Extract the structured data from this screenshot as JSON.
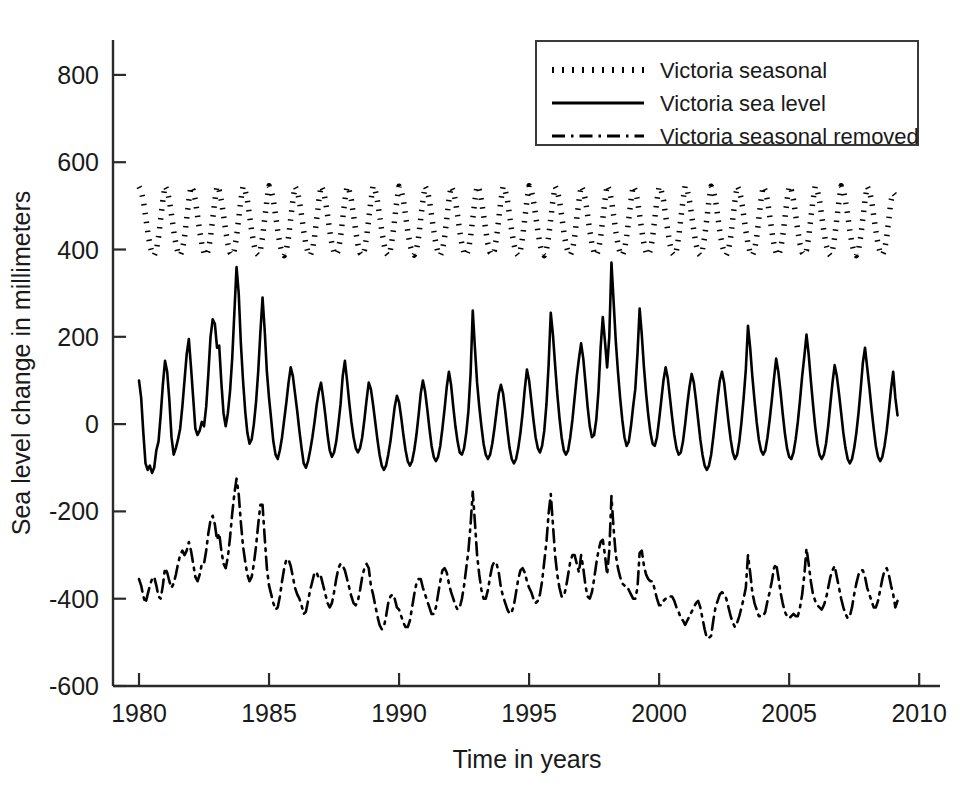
{
  "chart_data": {
    "type": "line",
    "title": "",
    "xlabel": "Time in years",
    "ylabel": "Sea level change in millimeters",
    "xlim": [
      1979.0,
      2010.8
    ],
    "ylim": [
      -600,
      880
    ],
    "xticks": [
      1980,
      1985,
      1990,
      1995,
      2000,
      2005,
      2010
    ],
    "xticklabels": [
      "1980",
      "1985",
      "1990",
      "1995",
      "2000",
      "2005",
      "2010"
    ],
    "yticks": [
      -600,
      -400,
      -200,
      0,
      200,
      400,
      600,
      800
    ],
    "yticklabels": [
      "-600",
      "-400",
      "-200",
      "0",
      "200",
      "400",
      "600",
      "800"
    ],
    "grid": false,
    "legend_position": "upper right",
    "axis_color": "#1a1a1a",
    "series": [
      {
        "name": "Victoria seasonal",
        "linestyle": "dotted",
        "color": "#000000",
        "x_start": 1980.0,
        "x_step": 0.0833333,
        "values": [
          544,
          534,
          512,
          478,
          442,
          412,
          392,
          386,
          398,
          428,
          470,
          512,
          546,
          536,
          513,
          479,
          443,
          413,
          392,
          386,
          398,
          428,
          470,
          513,
          545,
          535,
          513,
          478,
          442,
          412,
          392,
          386,
          398,
          428,
          470,
          512,
          546,
          536,
          512,
          479,
          443,
          413,
          393,
          386,
          399,
          429,
          471,
          513,
          545,
          535,
          513,
          478,
          442,
          412,
          392,
          387,
          398,
          428,
          470,
          512,
          546,
          536,
          513,
          479,
          443,
          413,
          392,
          386,
          398,
          428,
          470,
          513,
          545,
          535,
          512,
          478,
          442,
          412,
          392,
          386,
          399,
          429,
          470,
          512,
          546,
          536,
          513,
          479,
          443,
          413,
          393,
          387,
          398,
          428,
          471,
          513,
          545,
          535,
          513,
          478,
          442,
          412,
          392,
          386,
          398,
          428,
          470,
          512,
          546,
          536,
          512,
          479,
          443,
          413,
          392,
          386,
          399,
          429,
          470,
          513,
          545,
          535,
          513,
          478,
          442,
          412,
          393,
          387,
          398,
          428,
          471,
          512,
          546,
          536,
          513,
          479,
          443,
          413,
          392,
          386,
          398,
          428,
          470,
          513,
          545,
          535,
          512,
          478,
          442,
          412,
          392,
          386,
          399,
          429,
          470,
          512,
          546,
          536,
          513,
          479,
          443,
          413,
          393,
          387,
          398,
          428,
          471,
          513,
          545,
          535,
          513,
          478,
          442,
          412,
          392,
          386,
          398,
          428,
          470,
          512,
          546,
          536,
          512,
          479,
          443,
          413,
          392,
          386,
          399,
          429,
          470,
          513,
          545,
          535,
          513,
          478,
          442,
          412,
          393,
          387,
          398,
          428,
          471,
          512,
          546,
          536,
          513,
          479,
          443,
          413,
          392,
          386,
          398,
          428,
          470,
          513,
          548,
          537,
          513,
          478,
          442,
          412,
          392,
          386,
          399,
          429,
          470,
          512,
          546,
          536,
          513,
          479,
          443,
          413,
          393,
          387,
          398,
          428,
          471,
          513,
          545,
          535,
          513,
          478,
          442,
          412,
          392,
          386,
          398,
          428,
          470,
          512,
          546,
          536,
          512,
          479,
          443,
          413,
          392,
          386,
          399,
          429,
          470,
          513,
          545,
          535,
          513,
          478,
          442,
          412,
          393,
          387,
          398,
          428,
          471,
          512,
          546,
          536,
          513,
          479,
          443,
          413,
          392,
          386,
          398,
          428,
          470,
          513,
          545,
          535,
          512,
          478,
          442,
          412,
          392,
          386,
          399,
          429,
          470,
          512,
          546,
          536,
          513,
          479,
          443,
          413,
          393,
          387,
          398,
          428,
          471,
          513,
          545,
          535,
          513,
          478,
          442,
          412,
          392,
          386,
          398,
          428,
          470,
          512,
          546,
          536,
          512,
          479,
          443,
          413,
          392,
          386,
          399,
          429,
          470,
          513,
          545,
          535,
          513,
          478,
          442,
          412,
          393,
          387,
          398,
          428,
          471,
          512,
          530,
          524,
          512
        ]
      },
      {
        "name": "Victoria sea level",
        "linestyle": "solid",
        "color": "#000000",
        "x_start": 1980.0,
        "x_step": 0.0833333,
        "values": [
          100,
          60,
          -20,
          -90,
          -105,
          -95,
          -112,
          -100,
          -60,
          -40,
          20,
          90,
          145,
          120,
          55,
          -30,
          -70,
          -55,
          -35,
          -10,
          40,
          100,
          160,
          195,
          130,
          60,
          -10,
          -25,
          -15,
          5,
          -5,
          40,
          115,
          200,
          240,
          230,
          175,
          180,
          95,
          25,
          -5,
          25,
          75,
          150,
          255,
          360,
          300,
          185,
          100,
          30,
          -20,
          -45,
          -35,
          0,
          50,
          120,
          210,
          290,
          215,
          120,
          60,
          10,
          -40,
          -70,
          -80,
          -60,
          -30,
          10,
          50,
          95,
          130,
          110,
          70,
          30,
          -15,
          -55,
          -90,
          -100,
          -85,
          -60,
          -30,
          5,
          45,
          75,
          95,
          60,
          20,
          -25,
          -60,
          -75,
          -65,
          -40,
          0,
          45,
          110,
          145,
          100,
          50,
          5,
          -30,
          -55,
          -65,
          -55,
          -30,
          10,
          55,
          95,
          80,
          45,
          5,
          -35,
          -70,
          -95,
          -105,
          -95,
          -70,
          -40,
          0,
          40,
          65,
          50,
          15,
          -25,
          -60,
          -85,
          -95,
          -85,
          -60,
          -25,
          20,
          70,
          100,
          75,
          35,
          -10,
          -50,
          -75,
          -85,
          -75,
          -50,
          -10,
          35,
          85,
          120,
          90,
          40,
          -5,
          -40,
          -65,
          -70,
          -55,
          -20,
          30,
          115,
          260,
          175,
          95,
          40,
          -5,
          -45,
          -70,
          -80,
          -70,
          -45,
          -10,
          30,
          70,
          90,
          70,
          30,
          -15,
          -55,
          -80,
          -90,
          -80,
          -55,
          -20,
          25,
          80,
          125,
          100,
          55,
          10,
          -30,
          -55,
          -65,
          -50,
          -15,
          45,
          135,
          255,
          205,
          135,
          70,
          15,
          -30,
          -60,
          -70,
          -60,
          -30,
          10,
          60,
          110,
          150,
          185,
          150,
          95,
          40,
          -5,
          -30,
          -25,
          10,
          75,
          175,
          245,
          190,
          130,
          200,
          370,
          280,
          190,
          120,
          60,
          10,
          -30,
          -50,
          -40,
          -5,
          40,
          80,
          160,
          265,
          205,
          130,
          70,
          20,
          -20,
          -45,
          -50,
          -30,
          10,
          55,
          100,
          130,
          105,
          60,
          15,
          -25,
          -55,
          -70,
          -65,
          -40,
          0,
          45,
          85,
          115,
          95,
          55,
          10,
          -35,
          -70,
          -95,
          -105,
          -95,
          -70,
          -30,
          15,
          60,
          100,
          120,
          95,
          50,
          5,
          -35,
          -65,
          -80,
          -70,
          -40,
          5,
          60,
          125,
          225,
          175,
          110,
          55,
          5,
          -35,
          -60,
          -70,
          -60,
          -30,
          10,
          55,
          105,
          150,
          120,
          75,
          25,
          -20,
          -55,
          -75,
          -80,
          -65,
          -35,
          5,
          55,
          110,
          155,
          205,
          160,
          100,
          45,
          -5,
          -45,
          -70,
          -80,
          -70,
          -45,
          -5,
          45,
          95,
          135,
          110,
          70,
          25,
          -20,
          -55,
          -80,
          -90,
          -80,
          -55,
          -20,
          25,
          80,
          140,
          175,
          130,
          85,
          35,
          -10,
          -50,
          -75,
          -85,
          -75,
          -50,
          -15,
          30,
          80,
          120,
          60,
          20
        ]
      },
      {
        "name": "Victoria seasonal removed",
        "linestyle": "dashdot",
        "color": "#000000",
        "x_start": 1980.0,
        "x_step": 0.0833333,
        "values": [
          -355,
          -370,
          -395,
          -410,
          -390,
          -370,
          -355,
          -350,
          -370,
          -395,
          -400,
          -370,
          -330,
          -340,
          -360,
          -375,
          -365,
          -345,
          -320,
          -300,
          -290,
          -300,
          -290,
          -270,
          -290,
          -320,
          -350,
          -360,
          -345,
          -320,
          -320,
          -290,
          -250,
          -220,
          -210,
          -230,
          -265,
          -250,
          -290,
          -320,
          -330,
          -305,
          -260,
          -205,
          -160,
          -125,
          -160,
          -225,
          -280,
          -315,
          -345,
          -360,
          -350,
          -320,
          -280,
          -230,
          -185,
          -185,
          -260,
          -330,
          -370,
          -390,
          -410,
          -425,
          -420,
          -395,
          -360,
          -330,
          -310,
          -310,
          -325,
          -350,
          -375,
          -390,
          -400,
          -415,
          -435,
          -430,
          -405,
          -380,
          -360,
          -340,
          -340,
          -355,
          -350,
          -370,
          -390,
          -410,
          -420,
          -410,
          -385,
          -355,
          -330,
          -320,
          -325,
          -335,
          -355,
          -375,
          -395,
          -410,
          -415,
          -405,
          -380,
          -350,
          -330,
          -320,
          -330,
          -370,
          -390,
          -415,
          -440,
          -460,
          -470,
          -465,
          -440,
          -410,
          -395,
          -390,
          -400,
          -420,
          -425,
          -440,
          -455,
          -465,
          -465,
          -450,
          -420,
          -390,
          -365,
          -355,
          -355,
          -375,
          -390,
          -405,
          -420,
          -435,
          -435,
          -420,
          -390,
          -360,
          -335,
          -330,
          -340,
          -365,
          -385,
          -400,
          -415,
          -425,
          -420,
          -400,
          -370,
          -330,
          -290,
          -230,
          -155,
          -225,
          -300,
          -345,
          -380,
          -400,
          -400,
          -380,
          -350,
          -325,
          -315,
          -320,
          -340,
          -375,
          -395,
          -410,
          -425,
          -435,
          -430,
          -415,
          -385,
          -355,
          -335,
          -330,
          -340,
          -360,
          -375,
          -385,
          -400,
          -410,
          -405,
          -390,
          -360,
          -315,
          -270,
          -205,
          -160,
          -230,
          -300,
          -345,
          -375,
          -395,
          -395,
          -375,
          -345,
          -315,
          -300,
          -300,
          -320,
          -340,
          -300,
          -330,
          -370,
          -395,
          -400,
          -385,
          -355,
          -320,
          -290,
          -270,
          -265,
          -300,
          -345,
          -290,
          -165,
          -240,
          -300,
          -330,
          -350,
          -365,
          -370,
          -370,
          -380,
          -390,
          -400,
          -400,
          -375,
          -295,
          -290,
          -325,
          -345,
          -355,
          -360,
          -360,
          -380,
          -400,
          -415,
          -415,
          -405,
          -400,
          -400,
          -395,
          -395,
          -405,
          -420,
          -430,
          -445,
          -450,
          -460,
          -450,
          -440,
          -430,
          -420,
          -410,
          -405,
          -420,
          -445,
          -470,
          -490,
          -490,
          -485,
          -450,
          -420,
          -405,
          -390,
          -385,
          -390,
          -400,
          -420,
          -440,
          -455,
          -465,
          -455,
          -440,
          -420,
          -400,
          -375,
          -300,
          -340,
          -385,
          -410,
          -425,
          -440,
          -440,
          -440,
          -430,
          -405,
          -385,
          -360,
          -330,
          -320,
          -350,
          -385,
          -410,
          -430,
          -440,
          -445,
          -440,
          -435,
          -440,
          -440,
          -420,
          -390,
          -345,
          -285,
          -320,
          -360,
          -390,
          -405,
          -415,
          -420,
          -425,
          -415,
          -400,
          -375,
          -350,
          -335,
          -325,
          -350,
          -375,
          -400,
          -420,
          -435,
          -445,
          -440,
          -420,
          -390,
          -365,
          -345,
          -335,
          -335,
          -350,
          -375,
          -390,
          -405,
          -420,
          -420,
          -405,
          -380,
          -355,
          -335,
          -330,
          -345,
          -370,
          -390,
          -420,
          -405
        ]
      }
    ]
  },
  "legend": {
    "entries": [
      {
        "label": "Victoria seasonal",
        "style": "dotted"
      },
      {
        "label": "Victoria sea level",
        "style": "solid"
      },
      {
        "label": "Victoria seasonal removed",
        "style": "dashdot"
      }
    ]
  }
}
